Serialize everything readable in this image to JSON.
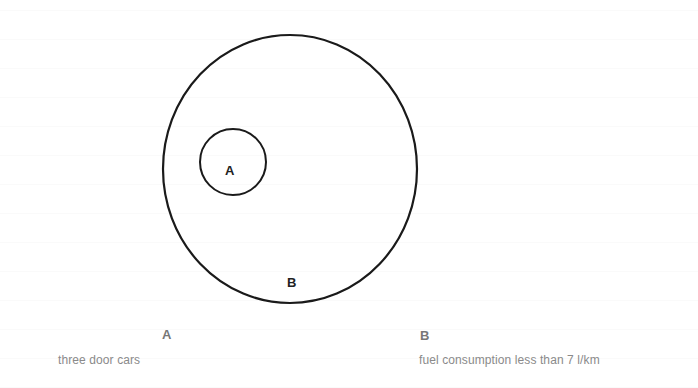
{
  "diagram": {
    "type": "venn-subset",
    "colors": {
      "stroke": "#1a1a1a",
      "circle_label": "#222222",
      "legend_label": "#777777",
      "legend_text": "#8a8a8a",
      "background": "#ffffff"
    },
    "sets": [
      {
        "id": "A",
        "circle_label": "A",
        "legend_label": "A",
        "legend_text": "three door cars",
        "contained_in": "B"
      },
      {
        "id": "B",
        "circle_label": "B",
        "legend_label": "B",
        "legend_text": "fuel consumption less than 7 l/km"
      }
    ]
  }
}
